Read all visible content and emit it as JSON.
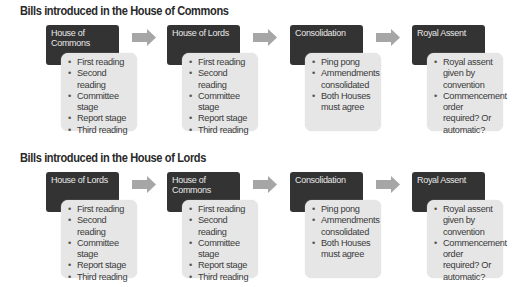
{
  "sections": [
    {
      "title": "Bills introduced in the House of Commons",
      "stages": [
        {
          "header": "House of Commons",
          "items": [
            "First reading",
            "Second reading",
            "Committee stage",
            "Report stage",
            "Third reading"
          ]
        },
        {
          "header": "House of Lords",
          "items": [
            "First reading",
            "Second reading",
            "Committee stage",
            "Report stage",
            "Third reading"
          ]
        },
        {
          "header": "Consolidation",
          "items": [
            "Ping pong",
            "Ammendments consolidated",
            "Both Houses must agree"
          ]
        },
        {
          "header": "Royal Assent",
          "items": [
            "Royal assent given by convention",
            "Commencement order required? Or automatic?"
          ]
        }
      ]
    },
    {
      "title": "Bills introduced in the House of Lords",
      "stages": [
        {
          "header": "House of Lords",
          "items": [
            "First reading",
            "Second reading",
            "Committee stage",
            "Report stage",
            "Third reading"
          ]
        },
        {
          "header": "House of Commons",
          "items": [
            "First reading",
            "Second reading",
            "Committee stage",
            "Report stage",
            "Third reading"
          ]
        },
        {
          "header": "Consolidation",
          "items": [
            "Ping pong",
            "Ammendments consolidated",
            "Both Houses must agree"
          ]
        },
        {
          "header": "Royal Assent",
          "items": [
            "Royal assent given by convention",
            "Commencement order required? Or automatic?"
          ]
        }
      ]
    }
  ],
  "colors": {
    "header_bg": "#333333",
    "body_bg": "#e6e6e6",
    "arrow": "#a6a6a6"
  }
}
